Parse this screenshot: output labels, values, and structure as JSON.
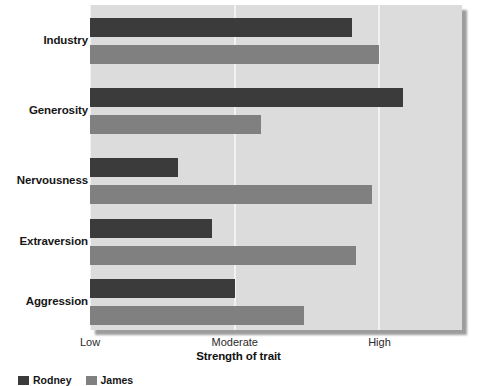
{
  "chart_data": {
    "type": "bar",
    "orientation": "horizontal",
    "title": "",
    "subtitle": "",
    "xlabel": "Strength of trait",
    "ylabel": "",
    "categories": [
      "Industry",
      "Generosity",
      "Nervousness",
      "Extraversion",
      "Aggression"
    ],
    "xtick_labels": [
      "Low",
      "Moderate",
      "High"
    ],
    "xtick_values": [
      0,
      1,
      2
    ],
    "xlim": [
      0,
      2.57
    ],
    "grid": true,
    "grid_axis": "x",
    "legend_position": "bottom-left",
    "series": [
      {
        "name": "Rodney",
        "color": "#3b3b3b",
        "values": [
          1.81,
          2.16,
          0.61,
          0.84,
          1.0
        ]
      },
      {
        "name": "James",
        "color": "#808080",
        "values": [
          2.0,
          1.18,
          1.95,
          1.84,
          1.48
        ]
      }
    ]
  },
  "style": {
    "plot_background": "#dcdcdc",
    "gridline_color": "#f2f2f2",
    "page_background": "#ffffff",
    "text_color": "#161616"
  }
}
